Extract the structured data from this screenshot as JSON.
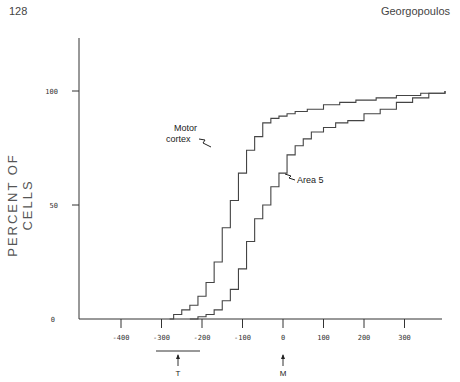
{
  "header": {
    "page_number": "128",
    "author": "Georgopoulos"
  },
  "chart_data": {
    "type": "line",
    "step": true,
    "title": "",
    "xlabel": "",
    "ylabel": "PERCENT OF CELLS",
    "xlim": [
      -500,
      400
    ],
    "ylim": [
      0,
      125
    ],
    "x_ticks": [
      -400,
      -300,
      -200,
      -100,
      0,
      100,
      200,
      300
    ],
    "y_ticks": [
      0,
      50,
      100
    ],
    "annotations": [
      {
        "text": "Motor cortex",
        "x": -170,
        "y": 74
      },
      {
        "text": "Area 5",
        "x": 30,
        "y": 71
      },
      {
        "text": "T",
        "x": -250,
        "note": "arrow below axis with horizontal bar spanning -300 to -200"
      },
      {
        "text": "M",
        "x": 0,
        "note": "arrow below axis"
      }
    ],
    "series": [
      {
        "name": "Motor cortex",
        "x": [
          -280,
          -270,
          -250,
          -230,
          -210,
          -190,
          -170,
          -150,
          -130,
          -110,
          -90,
          -70,
          -50,
          -30,
          -10,
          10,
          30,
          60,
          100,
          140,
          180,
          230,
          280,
          340,
          400
        ],
        "y": [
          0,
          2,
          4,
          6,
          10,
          16,
          25,
          40,
          52,
          64,
          74,
          80,
          86,
          88,
          89,
          90,
          91,
          92,
          94,
          95,
          96,
          97,
          98,
          99,
          100
        ]
      },
      {
        "name": "Area 5",
        "x": [
          -230,
          -210,
          -190,
          -170,
          -150,
          -130,
          -110,
          -90,
          -70,
          -50,
          -30,
          -10,
          10,
          30,
          50,
          70,
          100,
          130,
          160,
          200,
          240,
          280,
          320,
          360,
          400
        ],
        "y": [
          0,
          1,
          2,
          4,
          8,
          13,
          22,
          34,
          44,
          50,
          58,
          64,
          72,
          76,
          79,
          82,
          84,
          86,
          87,
          90,
          92,
          95,
          97,
          99,
          100
        ]
      }
    ]
  },
  "labels": {
    "ylabel": "PERCENT OF CELLS",
    "motor": [
      "Motor",
      "cortex"
    ],
    "area5": "Area 5",
    "t_marker": "T",
    "m_marker": "M"
  }
}
